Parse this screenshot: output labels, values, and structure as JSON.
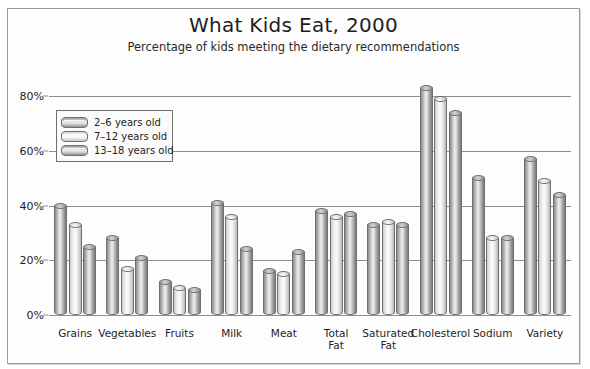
{
  "chart_data": {
    "type": "bar",
    "title": "What Kids Eat, 2000",
    "subtitle": "Percentage of kids meeting the dietary recommendations",
    "xlabel": "",
    "ylabel": "",
    "ylim": [
      0,
      90
    ],
    "yticks": [
      0,
      20,
      40,
      60,
      80
    ],
    "ytick_labels": [
      "0%",
      "20%",
      "40%",
      "60%",
      "80%"
    ],
    "grid": true,
    "legend_position": "upper-left-inside",
    "categories": [
      "Grains",
      "Vegetables",
      "Fruits",
      "Milk",
      "Meat",
      "Total\nFat",
      "Saturated\nFat",
      "Cholesterol",
      "Sodium",
      "Variety"
    ],
    "series": [
      {
        "name": "2–6 years old",
        "values": [
          40,
          28,
          12,
          41,
          16,
          38,
          33,
          83,
          50,
          57
        ]
      },
      {
        "name": "7–12 years old",
        "values": [
          33,
          17,
          10,
          36,
          15,
          36,
          34,
          79,
          28,
          49
        ]
      },
      {
        "name": "13–18 years old",
        "values": [
          25,
          21,
          9,
          24,
          23,
          37,
          33,
          74,
          28,
          44
        ]
      }
    ],
    "colors": {
      "series_1": "#a9a9a9",
      "series_2": "#e8e8e8",
      "series_3": "#a9a9a9",
      "gridline": "#8e8e8e",
      "text": "#1e1e1e",
      "frame": "#9b9b9b",
      "background": "#fdfdfd"
    }
  }
}
